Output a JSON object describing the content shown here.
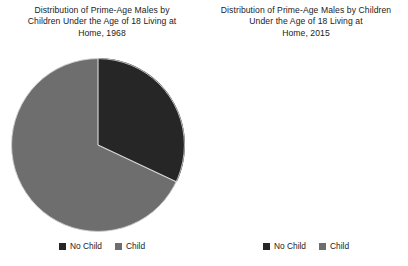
{
  "chart_data": [
    {
      "type": "pie",
      "title": "Distribution of Prime-Age Males by\nChildren Under the Age of 18 Living at\nHome, 1968",
      "year": "1968",
      "categories": [
        "No Child",
        "Child"
      ],
      "values": [
        32,
        68
      ],
      "units": "percent",
      "start_angle_deg": 0,
      "direction": "clockwise",
      "legend_position": "bottom",
      "grid": false,
      "colors": [
        "#262626",
        "#6e6e6e"
      ],
      "slices": [
        {
          "label": "No Child",
          "value": 32,
          "color": "#262626"
        },
        {
          "label": "Child",
          "value": 68,
          "color": "#6e6e6e"
        }
      ]
    },
    {
      "type": "pie",
      "title": "Distribution of Prime-Age Males by Children\nUnder the Age of 18 Living at\nHome, 2015",
      "year": "2015",
      "categories": [
        "No Child",
        "Child"
      ],
      "values": [
        52,
        48
      ],
      "units": "percent",
      "start_angle_deg": 0,
      "direction": "clockwise",
      "legend_position": "bottom",
      "grid": false,
      "colors": [
        "#262626",
        "#6e6e6e"
      ],
      "slices": [
        {
          "label": "No Child",
          "value": 52,
          "color": "#262626"
        },
        {
          "label": "Child",
          "value": 48,
          "color": "#6e6e6e"
        }
      ]
    }
  ],
  "panels": [
    {
      "title": "Distribution of Prime-Age Males by\nChildren Under the Age of 18 Living at\nHome, 1968",
      "legend": [
        {
          "label": "No Child",
          "color": "#262626"
        },
        {
          "label": "Child",
          "color": "#6e6e6e"
        }
      ]
    },
    {
      "title": "Distribution of Prime-Age Males by Children\nUnder the Age of 18 Living at\nHome, 2015",
      "legend": [
        {
          "label": "No Child",
          "color": "#262626"
        },
        {
          "label": "Child",
          "color": "#6e6e6e"
        }
      ]
    }
  ],
  "style": {
    "background": "#ffffff",
    "text_color": "#1b1b1b",
    "slice_border": "#d9d9d9",
    "no_child_color": "#262626",
    "child_color": "#6e6e6e"
  }
}
